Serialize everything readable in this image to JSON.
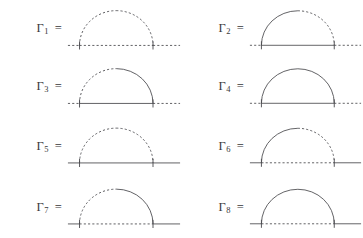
{
  "figure": {
    "title": "",
    "background_color": "#ffffff",
    "line_color": "#4a4a4e",
    "columns": 2,
    "rows": 4
  },
  "diagrams": [
    {
      "id": "gamma-1",
      "gamma": "Γ",
      "index": "1",
      "equals": "=",
      "arc": {
        "left_style": "dashed",
        "right_style": "dashed"
      },
      "baseline": {
        "left_tail": "dashed",
        "middle": "dashed",
        "right_tail": "dashed"
      },
      "vertices": 2
    },
    {
      "id": "gamma-2",
      "gamma": "Γ",
      "index": "2",
      "equals": "=",
      "arc": {
        "left_style": "solid",
        "right_style": "dashed"
      },
      "baseline": {
        "left_tail": "dashed",
        "middle": "solid",
        "right_tail": "dashed"
      },
      "vertices": 2
    },
    {
      "id": "gamma-3",
      "gamma": "Γ",
      "index": "3",
      "equals": "=",
      "arc": {
        "left_style": "dashed",
        "right_style": "solid"
      },
      "baseline": {
        "left_tail": "dashed",
        "middle": "solid",
        "right_tail": "dashed"
      },
      "vertices": 2
    },
    {
      "id": "gamma-4",
      "gamma": "Γ",
      "index": "4",
      "equals": "=",
      "arc": {
        "left_style": "solid",
        "right_style": "solid"
      },
      "baseline": {
        "left_tail": "dashed",
        "middle": "solid",
        "right_tail": "dashed"
      },
      "vertices": 2
    },
    {
      "id": "gamma-5",
      "gamma": "Γ",
      "index": "5",
      "equals": "=",
      "arc": {
        "left_style": "dashed",
        "right_style": "dashed"
      },
      "baseline": {
        "left_tail": "solid",
        "middle": "solid",
        "right_tail": "solid"
      },
      "vertices": 2
    },
    {
      "id": "gamma-6",
      "gamma": "Γ",
      "index": "6",
      "equals": "=",
      "arc": {
        "left_style": "solid",
        "right_style": "dashed"
      },
      "baseline": {
        "left_tail": "solid",
        "middle": "dashed",
        "right_tail": "solid"
      },
      "vertices": 2
    },
    {
      "id": "gamma-7",
      "gamma": "Γ",
      "index": "7",
      "equals": "=",
      "arc": {
        "left_style": "dashed",
        "right_style": "solid"
      },
      "baseline": {
        "left_tail": "solid",
        "middle": "dashed",
        "right_tail": "solid"
      },
      "vertices": 2
    },
    {
      "id": "gamma-8",
      "gamma": "Γ",
      "index": "8",
      "equals": "=",
      "arc": {
        "left_style": "solid",
        "right_style": "solid"
      },
      "baseline": {
        "left_tail": "solid",
        "middle": "dashed",
        "right_tail": "solid"
      },
      "vertices": 2
    }
  ]
}
